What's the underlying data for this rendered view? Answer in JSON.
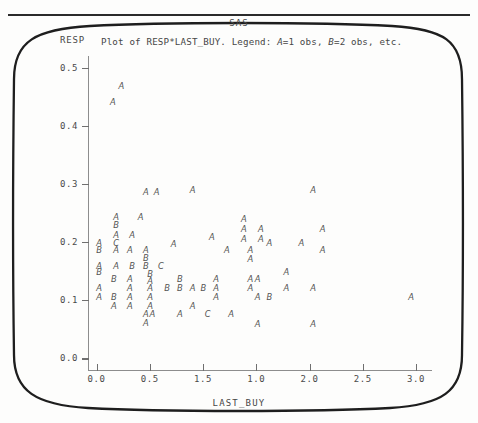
{
  "page": {
    "system_title": "SAS",
    "subtitle_prefix": "Plot of RESP*LAST_BUY. Legend: ",
    "legend_a_symbol": "A",
    "legend_a_text": "=1 obs, ",
    "legend_b_symbol": "B",
    "legend_b_text": "=2 obs, etc.",
    "y_axis_name": "RESP",
    "x_axis_name": "LAST_BUY"
  },
  "chart_data": {
    "type": "scatter",
    "title": "SAS",
    "subtitle": "Plot of RESP*LAST_BUY. Legend: A=1 obs, B=2 obs, etc.",
    "xlabel": "LAST_BUY",
    "ylabel": "RESP",
    "xlim": [
      -0.08,
      3.15
    ],
    "ylim": [
      -0.02,
      0.52
    ],
    "xticks": [
      0.0,
      0.5,
      1.5,
      1.0,
      2.0,
      2.5,
      3.0
    ],
    "xtick_labels": [
      "0.0",
      "0.5",
      "1.5",
      "1.0",
      "2.0",
      "2.5",
      "3.0"
    ],
    "xtick_positions": [
      0.0,
      0.5,
      1.0,
      1.5,
      2.0,
      2.5,
      3.0
    ],
    "yticks": [
      0.0,
      0.1,
      0.2,
      0.3,
      0.4,
      0.5
    ],
    "ytick_labels": [
      "0.0",
      "0.1",
      "0.2",
      "0.3",
      "0.4",
      "0.5"
    ],
    "grid": false,
    "legend_position": "none",
    "marker_legend": {
      "A": 1,
      "B": 2,
      "C": 3
    },
    "points": [
      {
        "x": 0.23,
        "y": 0.468,
        "label": "A"
      },
      {
        "x": 0.15,
        "y": 0.44,
        "label": "A"
      },
      {
        "x": 0.46,
        "y": 0.285,
        "label": "A"
      },
      {
        "x": 0.56,
        "y": 0.285,
        "label": "A"
      },
      {
        "x": 0.9,
        "y": 0.288,
        "label": "A"
      },
      {
        "x": 2.03,
        "y": 0.288,
        "label": "A"
      },
      {
        "x": 0.18,
        "y": 0.243,
        "label": "A"
      },
      {
        "x": 0.41,
        "y": 0.243,
        "label": "A"
      },
      {
        "x": 1.38,
        "y": 0.238,
        "label": "A"
      },
      {
        "x": 0.18,
        "y": 0.228,
        "label": "B"
      },
      {
        "x": 1.54,
        "y": 0.222,
        "label": "A"
      },
      {
        "x": 1.38,
        "y": 0.222,
        "label": "A"
      },
      {
        "x": 2.12,
        "y": 0.222,
        "label": "A"
      },
      {
        "x": 0.18,
        "y": 0.212,
        "label": "A"
      },
      {
        "x": 0.33,
        "y": 0.212,
        "label": "A"
      },
      {
        "x": 1.08,
        "y": 0.208,
        "label": "A"
      },
      {
        "x": 1.38,
        "y": 0.205,
        "label": "A"
      },
      {
        "x": 1.54,
        "y": 0.205,
        "label": "A"
      },
      {
        "x": 0.02,
        "y": 0.197,
        "label": "A"
      },
      {
        "x": 0.18,
        "y": 0.197,
        "label": "C"
      },
      {
        "x": 0.72,
        "y": 0.195,
        "label": "A"
      },
      {
        "x": 1.62,
        "y": 0.197,
        "label": "A"
      },
      {
        "x": 1.92,
        "y": 0.197,
        "label": "A"
      },
      {
        "x": 0.02,
        "y": 0.185,
        "label": "B"
      },
      {
        "x": 0.18,
        "y": 0.185,
        "label": "A"
      },
      {
        "x": 0.31,
        "y": 0.185,
        "label": "A"
      },
      {
        "x": 0.46,
        "y": 0.185,
        "label": "A"
      },
      {
        "x": 1.22,
        "y": 0.185,
        "label": "A"
      },
      {
        "x": 1.44,
        "y": 0.185,
        "label": "A"
      },
      {
        "x": 2.12,
        "y": 0.185,
        "label": "A"
      },
      {
        "x": 0.46,
        "y": 0.172,
        "label": "B"
      },
      {
        "x": 1.44,
        "y": 0.17,
        "label": "A"
      },
      {
        "x": 0.02,
        "y": 0.158,
        "label": "A"
      },
      {
        "x": 0.18,
        "y": 0.158,
        "label": "A"
      },
      {
        "x": 0.33,
        "y": 0.158,
        "label": "B"
      },
      {
        "x": 0.46,
        "y": 0.158,
        "label": "B"
      },
      {
        "x": 0.6,
        "y": 0.158,
        "label": "C"
      },
      {
        "x": 0.02,
        "y": 0.147,
        "label": "B"
      },
      {
        "x": 0.5,
        "y": 0.145,
        "label": "B"
      },
      {
        "x": 1.78,
        "y": 0.147,
        "label": "A"
      },
      {
        "x": 0.16,
        "y": 0.135,
        "label": "B"
      },
      {
        "x": 0.31,
        "y": 0.135,
        "label": "A"
      },
      {
        "x": 0.5,
        "y": 0.133,
        "label": "A"
      },
      {
        "x": 0.78,
        "y": 0.135,
        "label": "B"
      },
      {
        "x": 1.12,
        "y": 0.135,
        "label": "A"
      },
      {
        "x": 1.44,
        "y": 0.135,
        "label": "A"
      },
      {
        "x": 1.51,
        "y": 0.135,
        "label": "A"
      },
      {
        "x": 0.02,
        "y": 0.12,
        "label": "A"
      },
      {
        "x": 0.31,
        "y": 0.12,
        "label": "A"
      },
      {
        "x": 0.5,
        "y": 0.12,
        "label": "A"
      },
      {
        "x": 0.66,
        "y": 0.12,
        "label": "B"
      },
      {
        "x": 0.78,
        "y": 0.12,
        "label": "B"
      },
      {
        "x": 0.9,
        "y": 0.12,
        "label": "A"
      },
      {
        "x": 1.0,
        "y": 0.12,
        "label": "B"
      },
      {
        "x": 1.12,
        "y": 0.12,
        "label": "A"
      },
      {
        "x": 1.44,
        "y": 0.12,
        "label": "A"
      },
      {
        "x": 1.78,
        "y": 0.12,
        "label": "A"
      },
      {
        "x": 2.03,
        "y": 0.12,
        "label": "A"
      },
      {
        "x": 0.02,
        "y": 0.105,
        "label": "A"
      },
      {
        "x": 0.16,
        "y": 0.105,
        "label": "B"
      },
      {
        "x": 0.31,
        "y": 0.105,
        "label": "A"
      },
      {
        "x": 0.5,
        "y": 0.105,
        "label": "A"
      },
      {
        "x": 1.12,
        "y": 0.105,
        "label": "A"
      },
      {
        "x": 1.51,
        "y": 0.105,
        "label": "A"
      },
      {
        "x": 1.62,
        "y": 0.105,
        "label": "B"
      },
      {
        "x": 2.95,
        "y": 0.105,
        "label": "A"
      },
      {
        "x": 0.16,
        "y": 0.09,
        "label": "A"
      },
      {
        "x": 0.31,
        "y": 0.09,
        "label": "A"
      },
      {
        "x": 0.5,
        "y": 0.09,
        "label": "A"
      },
      {
        "x": 0.9,
        "y": 0.09,
        "label": "A"
      },
      {
        "x": 0.46,
        "y": 0.075,
        "label": "A"
      },
      {
        "x": 0.52,
        "y": 0.075,
        "label": "A"
      },
      {
        "x": 0.78,
        "y": 0.075,
        "label": "A"
      },
      {
        "x": 1.04,
        "y": 0.075,
        "label": "C"
      },
      {
        "x": 1.26,
        "y": 0.075,
        "label": "A"
      },
      {
        "x": 0.46,
        "y": 0.06,
        "label": "A"
      },
      {
        "x": 1.51,
        "y": 0.058,
        "label": "A"
      },
      {
        "x": 2.03,
        "y": 0.058,
        "label": "A"
      }
    ]
  }
}
